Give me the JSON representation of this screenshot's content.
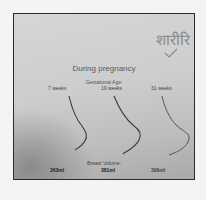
{
  "slide": {
    "hindi_text": "शारीरि",
    "title": "During pregnancy",
    "gestational_label": "Gestational Age:",
    "weeks": [
      "7 weeks",
      "19 weeks",
      "31 weeks"
    ],
    "volume_label": "Breast Volume:",
    "volumes": [
      "263ml",
      "381ml",
      "396ml"
    ]
  },
  "colors": {
    "frame_border": "#2a2a2a",
    "background": "#cdcdcd",
    "outline": "#3a3a3a"
  }
}
